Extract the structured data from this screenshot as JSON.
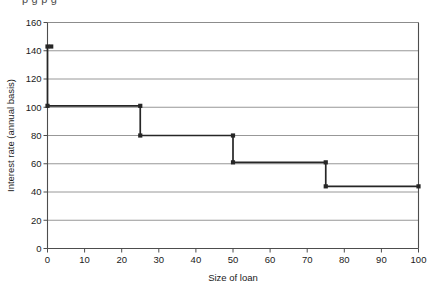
{
  "figure": {
    "partial_top_text": "p g p g",
    "background_color": "#ffffff",
    "line_color": "#262626",
    "grid_color": "#8c8c8c",
    "axis_color": "#4d4d4d"
  },
  "chart_data": {
    "type": "line",
    "subtype": "step",
    "title": "",
    "xlabel": "Size of loan",
    "ylabel": "Interest rate (annual basis)",
    "xlim": [
      0,
      100
    ],
    "ylim": [
      0,
      160
    ],
    "xticks": [
      0,
      10,
      20,
      30,
      40,
      50,
      60,
      70,
      80,
      90,
      100
    ],
    "yticks": [
      0,
      20,
      40,
      60,
      80,
      100,
      120,
      140,
      160
    ],
    "xtick_labels": [
      "0",
      "10",
      "20",
      "30",
      "40",
      "50",
      "60",
      "70",
      "80",
      "90",
      "100"
    ],
    "ytick_labels": [
      "0",
      "20",
      "40",
      "60",
      "80",
      "100",
      "120",
      "140",
      "160"
    ],
    "grid": "horizontal",
    "legend": "none",
    "series": [
      {
        "name": "Interest rate",
        "steps": [
          {
            "x_start": 0,
            "x_end": 0,
            "y": 143
          },
          {
            "x_start": 0,
            "x_end": 25,
            "y": 101
          },
          {
            "x_start": 25,
            "x_end": 50,
            "y": 80
          },
          {
            "x_start": 50,
            "x_end": 75,
            "y": 61
          },
          {
            "x_start": 75,
            "x_end": 100,
            "y": 44
          }
        ],
        "markers": [
          {
            "x": 0,
            "y": 143
          },
          {
            "x": 1,
            "y": 143
          },
          {
            "x": 0,
            "y": 101
          },
          {
            "x": 25,
            "y": 101
          },
          {
            "x": 25,
            "y": 80
          },
          {
            "x": 50,
            "y": 80
          },
          {
            "x": 50,
            "y": 61
          },
          {
            "x": 75,
            "y": 61
          },
          {
            "x": 75,
            "y": 44
          },
          {
            "x": 100,
            "y": 44
          }
        ]
      }
    ]
  }
}
